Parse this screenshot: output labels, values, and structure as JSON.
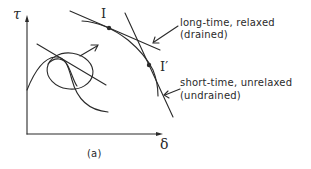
{
  "figure": {
    "panel_label": "(a)",
    "axes": {
      "y_label": "τ",
      "x_label": "δ"
    },
    "points": [
      {
        "label": "I"
      },
      {
        "label": "I′"
      }
    ],
    "annotations": [
      {
        "line1": "long-time, relaxed",
        "line2": "(drained)"
      },
      {
        "line1": "short-time, unrelaxed",
        "line2": "(undrained)"
      }
    ],
    "colors": {
      "ink": "#2a2a2a",
      "background": "#ffffff"
    }
  }
}
